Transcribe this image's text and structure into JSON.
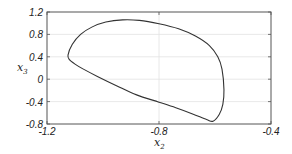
{
  "chart_data": {
    "type": "line",
    "title": "",
    "xlabel": "x2",
    "ylabel": "x3",
    "xlim": [
      -1.2,
      -0.4
    ],
    "ylim": [
      -0.8,
      1.2
    ],
    "xticks": [
      -1.2,
      -0.8,
      -0.4
    ],
    "xtick_labels": [
      "-1.2",
      "-0.8",
      "-0.4"
    ],
    "yticks": [
      -0.8,
      -0.4,
      0,
      0.4,
      0.8,
      1.2
    ],
    "ytick_labels": [
      "-0.8",
      "-0.4",
      "0",
      "0.4",
      "0.8",
      "1.2"
    ],
    "grid": true,
    "legend": null,
    "series": [
      {
        "name": "limit cycle",
        "closed": true,
        "color": "#333333",
        "x": [
          -1.125,
          -1.11,
          -1.08,
          -1.04,
          -0.99,
          -0.93,
          -0.87,
          -0.8,
          -0.73,
          -0.67,
          -0.62,
          -0.59,
          -0.575,
          -0.568,
          -0.572,
          -0.585,
          -0.607,
          -0.63,
          -0.68,
          -0.74,
          -0.8,
          -0.88,
          -0.95,
          -1.02,
          -1.07,
          -1.1,
          -1.12,
          -1.125
        ],
        "y": [
          0.43,
          0.62,
          0.8,
          0.93,
          1.02,
          1.06,
          1.05,
          0.99,
          0.9,
          0.77,
          0.6,
          0.4,
          0.18,
          -0.19,
          -0.45,
          -0.63,
          -0.75,
          -0.72,
          -0.62,
          -0.51,
          -0.41,
          -0.28,
          -0.12,
          0.05,
          0.18,
          0.27,
          0.35,
          0.43
        ]
      }
    ]
  },
  "labels": {
    "x_main": "x",
    "x_sub": "2",
    "y_main": "x",
    "y_sub": "3"
  }
}
